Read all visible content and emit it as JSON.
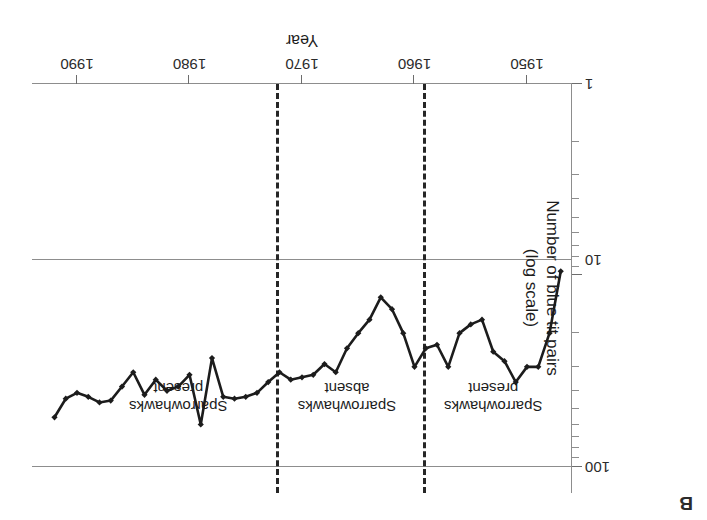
{
  "panel": {
    "label": "B"
  },
  "axes": {
    "y": {
      "title_line1": "Number of blue tit pairs",
      "title_line2": "(log scale)",
      "ticks": [
        {
          "value": 100,
          "label": "100"
        },
        {
          "value": 10,
          "label": "10"
        },
        {
          "value": 1,
          "label": "1"
        }
      ],
      "scale": "log",
      "range": [
        1,
        100
      ]
    },
    "x": {
      "title": "Year",
      "ticks": [
        1950,
        1960,
        1970,
        1980,
        1990
      ],
      "tick_labels": [
        "1950",
        "1960",
        "1970",
        "1980",
        "1990"
      ],
      "range": [
        1946,
        1994
      ]
    }
  },
  "annotations": [
    {
      "name": "sparrowhawks-present-early",
      "line1": "Sparrowhawks",
      "line2": "present",
      "x_center": 1953.0
    },
    {
      "name": "sparrowhawks-absent",
      "line1": "Sparrowhawks",
      "line2": "absent",
      "x_center": 1966.0
    },
    {
      "name": "sparrowhawks-present-late",
      "line1": "Sparrowhawks",
      "line2": "present",
      "x_center": 1981.0
    }
  ],
  "dividers": [
    {
      "name": "divider-1959",
      "x": 1959.0
    },
    {
      "name": "divider-1972",
      "x": 1972.0
    }
  ],
  "chart_data": {
    "type": "line",
    "title": "",
    "xlabel": "Year",
    "ylabel": "Number of blue tit pairs (log scale)",
    "xlim": [
      1946,
      1994
    ],
    "ylim": [
      1,
      100
    ],
    "yscale": "log",
    "grid": true,
    "legend": false,
    "markers": "diamond",
    "line_color": "#1c1c1c",
    "series": [
      {
        "name": "Blue tit pairs",
        "x": [
          1947,
          1948,
          1949,
          1950,
          1951,
          1952,
          1953,
          1954,
          1955,
          1956,
          1957,
          1958,
          1959,
          1960,
          1961,
          1962,
          1963,
          1964,
          1965,
          1966,
          1967,
          1968,
          1969,
          1970,
          1971,
          1972,
          1973,
          1974,
          1975,
          1976,
          1977,
          1978,
          1979,
          1980,
          1981,
          1982,
          1983,
          1984,
          1985,
          1986,
          1987,
          1988,
          1989,
          1990,
          1991,
          1992
        ],
        "values": [
          9.5,
          20,
          30,
          30,
          36,
          28,
          25,
          17,
          18,
          20,
          30,
          23,
          24,
          30,
          20,
          15,
          13,
          17,
          20,
          24,
          32,
          29,
          33,
          34,
          35,
          32,
          36,
          41,
          43,
          44,
          43,
          27,
          60,
          33,
          38,
          40,
          35,
          42,
          32,
          38,
          45,
          46,
          43,
          41,
          44,
          55
        ]
      }
    ]
  }
}
